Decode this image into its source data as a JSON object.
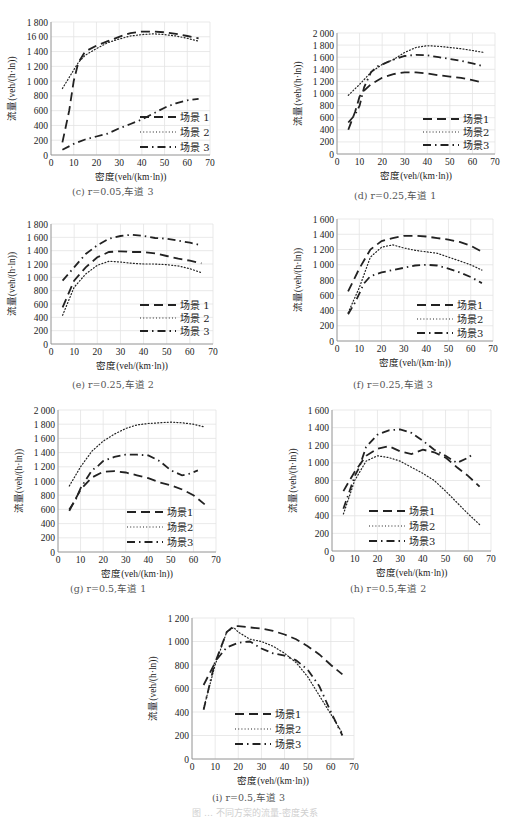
{
  "figure_caption_partial": "图 … 不同方案的流量-密度关系",
  "chart_data": [
    {
      "id": "c",
      "type": "line",
      "caption": "(c) r=0.05,车道 3",
      "xlabel": "密度(veh/(km·ln))",
      "ylabel": "流量(veh/(h·ln))",
      "xlim": [
        0,
        70
      ],
      "ylim": [
        0,
        1800
      ],
      "xticks": [
        "0",
        "10",
        "20",
        "30",
        "40",
        "50",
        "60",
        "70"
      ],
      "yticks": [
        "0",
        "200",
        "400",
        "600",
        "800",
        "1 000",
        "1 200",
        "1 400",
        "16 00",
        "1 800"
      ],
      "grid": true,
      "legend": "bottom-right",
      "series": [
        {
          "name": "场景 1",
          "style": "dash",
          "x": [
            5,
            8,
            10,
            12,
            15,
            20,
            25,
            30,
            35,
            40,
            45,
            50,
            55,
            60,
            65
          ],
          "y": [
            170,
            600,
            1000,
            1250,
            1400,
            1480,
            1540,
            1600,
            1650,
            1670,
            1670,
            1660,
            1640,
            1610,
            1580
          ]
        },
        {
          "name": "场景 2",
          "style": "dot",
          "x": [
            5,
            8,
            10,
            12,
            15,
            20,
            25,
            30,
            35,
            40,
            45,
            50,
            55,
            60,
            65
          ],
          "y": [
            900,
            1050,
            1150,
            1250,
            1350,
            1440,
            1520,
            1570,
            1610,
            1630,
            1640,
            1630,
            1610,
            1580,
            1540
          ]
        },
        {
          "name": "场景 3",
          "style": "dashdot",
          "x": [
            5,
            10,
            15,
            20,
            25,
            30,
            35,
            40,
            45,
            50,
            55,
            60,
            65
          ],
          "y": [
            70,
            150,
            210,
            250,
            290,
            360,
            420,
            480,
            560,
            640,
            700,
            740,
            760
          ]
        }
      ]
    },
    {
      "id": "d",
      "type": "line",
      "caption": "(d) r=0.25,车道 1",
      "xlabel": "密度(veh/(km·ln))",
      "ylabel": "流量(veh/(h·ln))",
      "xlim": [
        0,
        70
      ],
      "ylim": [
        0,
        2000
      ],
      "xticks": [
        "0",
        "10",
        "20",
        "30",
        "40",
        "50",
        "60",
        "70"
      ],
      "yticks": [
        "0",
        "200",
        "400",
        "600",
        "800",
        "1 000",
        "1 200",
        "1 400",
        "1 600",
        "1 800",
        "2 000"
      ],
      "grid": true,
      "legend": "bottom-right",
      "series": [
        {
          "name": "场景1",
          "style": "dash",
          "x": [
            5,
            8,
            10,
            12,
            15,
            20,
            25,
            30,
            35,
            40,
            45,
            50,
            55,
            60,
            65
          ],
          "y": [
            400,
            700,
            950,
            1050,
            1150,
            1260,
            1320,
            1350,
            1350,
            1330,
            1300,
            1280,
            1260,
            1220,
            1180
          ]
        },
        {
          "name": "场景2",
          "style": "dot",
          "x": [
            5,
            10,
            15,
            20,
            25,
            30,
            35,
            40,
            45,
            50,
            55,
            60,
            65
          ],
          "y": [
            970,
            1150,
            1350,
            1480,
            1560,
            1680,
            1760,
            1790,
            1780,
            1760,
            1740,
            1710,
            1680
          ]
        },
        {
          "name": "场景3",
          "style": "dashdot",
          "x": [
            5,
            8,
            10,
            12,
            15,
            18,
            20,
            25,
            30,
            35,
            40,
            45,
            50,
            55,
            60,
            65
          ],
          "y": [
            520,
            650,
            800,
            1100,
            1350,
            1450,
            1480,
            1560,
            1620,
            1640,
            1630,
            1600,
            1570,
            1540,
            1500,
            1450
          ]
        }
      ]
    },
    {
      "id": "e",
      "type": "line",
      "caption": "(e) r=0.25,车道 2",
      "xlabel": "密度(veh/(km·ln))",
      "ylabel": "流量(veh/(h·ln))",
      "xlim": [
        0,
        70
      ],
      "ylim": [
        0,
        1800
      ],
      "xticks": [
        "0",
        "10",
        "20",
        "30",
        "40",
        "50",
        "60",
        "70"
      ],
      "yticks": [
        "0",
        "200",
        "400",
        "600",
        "800",
        "1 000",
        "1 200",
        "1 400",
        "1 600",
        "1 800"
      ],
      "grid": true,
      "legend": "bottom-right",
      "series": [
        {
          "name": "场景 1",
          "style": "dash",
          "x": [
            5,
            10,
            15,
            20,
            25,
            30,
            35,
            40,
            45,
            50,
            55,
            60,
            65
          ],
          "y": [
            550,
            950,
            1150,
            1300,
            1380,
            1390,
            1380,
            1380,
            1360,
            1320,
            1280,
            1250,
            1210
          ]
        },
        {
          "name": "场景 2",
          "style": "dot",
          "x": [
            5,
            10,
            15,
            20,
            25,
            30,
            35,
            40,
            45,
            50,
            55,
            60,
            65
          ],
          "y": [
            430,
            850,
            1050,
            1180,
            1240,
            1230,
            1210,
            1200,
            1200,
            1190,
            1170,
            1130,
            1070
          ]
        },
        {
          "name": "场景 3",
          "style": "dashdot",
          "x": [
            5,
            10,
            15,
            20,
            25,
            30,
            35,
            40,
            45,
            50,
            55,
            60,
            65
          ],
          "y": [
            950,
            1150,
            1350,
            1480,
            1580,
            1620,
            1640,
            1620,
            1590,
            1580,
            1550,
            1520,
            1480
          ]
        }
      ]
    },
    {
      "id": "f",
      "type": "line",
      "caption": "(f) r=0.25,车道 3",
      "xlabel": "密度(veh/(km·ln))",
      "ylabel": "流量(veh/(h·ln))",
      "xlim": [
        0,
        70
      ],
      "ylim": [
        0,
        1600
      ],
      "xticks": [
        "0",
        "10",
        "20",
        "30",
        "40",
        "50",
        "60",
        "70"
      ],
      "yticks": [
        "0",
        "200",
        "400",
        "600",
        "800",
        "1 000",
        "1 200",
        "1 400",
        "1 600"
      ],
      "grid": true,
      "legend": "bottom-right",
      "series": [
        {
          "name": "场景1",
          "style": "dash",
          "x": [
            5,
            10,
            15,
            20,
            25,
            30,
            35,
            40,
            45,
            50,
            55,
            60,
            65
          ],
          "y": [
            650,
            950,
            1200,
            1310,
            1350,
            1380,
            1380,
            1370,
            1350,
            1330,
            1300,
            1250,
            1170
          ]
        },
        {
          "name": "场景2",
          "style": "dot",
          "x": [
            5,
            10,
            15,
            20,
            25,
            30,
            35,
            40,
            45,
            50,
            55,
            60,
            65
          ],
          "y": [
            370,
            700,
            1100,
            1230,
            1260,
            1220,
            1190,
            1170,
            1150,
            1100,
            1050,
            1000,
            930
          ]
        },
        {
          "name": "场景3",
          "style": "dashdot",
          "x": [
            5,
            8,
            10,
            12,
            15,
            20,
            25,
            30,
            35,
            40,
            45,
            50,
            55,
            60,
            65
          ],
          "y": [
            350,
            500,
            620,
            750,
            850,
            900,
            930,
            960,
            990,
            1000,
            990,
            950,
            900,
            840,
            760
          ]
        }
      ]
    },
    {
      "id": "g",
      "type": "line",
      "caption": "(g) r=0.5,车道 1",
      "xlabel": "密度(veh/(km·ln))",
      "ylabel": "流量(veh/(h·ln))",
      "xlim": [
        0,
        70
      ],
      "ylim": [
        0,
        2000
      ],
      "xticks": [
        "0",
        "10",
        "20",
        "30",
        "40",
        "50",
        "60",
        "70"
      ],
      "yticks": [
        "0",
        "200",
        "400",
        "600",
        "800",
        "1 000",
        "1 200",
        "1 400",
        "1 600",
        "1 800",
        "2 000"
      ],
      "grid": true,
      "legend": "bottom-right",
      "series": [
        {
          "name": "场景1",
          "style": "dash",
          "x": [
            5,
            10,
            15,
            20,
            25,
            30,
            35,
            40,
            45,
            50,
            55,
            60,
            65
          ],
          "y": [
            580,
            880,
            1050,
            1130,
            1140,
            1120,
            1080,
            1040,
            980,
            940,
            880,
            800,
            670
          ]
        },
        {
          "name": "场景2",
          "style": "dot",
          "x": [
            5,
            10,
            15,
            20,
            25,
            30,
            35,
            40,
            45,
            50,
            55,
            60,
            65
          ],
          "y": [
            930,
            1200,
            1420,
            1560,
            1660,
            1740,
            1790,
            1810,
            1820,
            1830,
            1820,
            1800,
            1760
          ]
        },
        {
          "name": "场景3",
          "style": "dashdot",
          "x": [
            5,
            8,
            10,
            12,
            15,
            18,
            20,
            25,
            30,
            35,
            40,
            45,
            50,
            55,
            58,
            62
          ],
          "y": [
            600,
            750,
            900,
            1000,
            1150,
            1220,
            1280,
            1340,
            1370,
            1370,
            1360,
            1280,
            1150,
            1080,
            1100,
            1150
          ]
        }
      ]
    },
    {
      "id": "h",
      "type": "line",
      "caption": "(h) r=0.5,车道 2",
      "xlabel": "密度(veh/(km·ln))",
      "ylabel": "流量(veh/(h·ln))",
      "xlim": [
        0,
        70
      ],
      "ylim": [
        0,
        1600
      ],
      "xticks": [
        "0",
        "10",
        "20",
        "30",
        "40",
        "50",
        "60",
        "70"
      ],
      "yticks": [
        "0",
        "200",
        "400",
        "600",
        "800",
        "1 000",
        "1 200",
        "1 400",
        "1 600"
      ],
      "grid": true,
      "legend": "bottom-left",
      "series": [
        {
          "name": "场景1",
          "style": "dash",
          "x": [
            5,
            10,
            15,
            20,
            25,
            30,
            35,
            40,
            45,
            50,
            55,
            60,
            65
          ],
          "y": [
            680,
            900,
            1080,
            1160,
            1190,
            1130,
            1100,
            1150,
            1120,
            1060,
            950,
            850,
            730
          ]
        },
        {
          "name": "场景2",
          "style": "dot",
          "x": [
            5,
            10,
            15,
            20,
            25,
            30,
            35,
            40,
            45,
            50,
            55,
            60,
            65
          ],
          "y": [
            420,
            800,
            1020,
            1080,
            1060,
            1020,
            950,
            880,
            800,
            680,
            550,
            420,
            300
          ]
        },
        {
          "name": "场景3",
          "style": "dashdot",
          "x": [
            5,
            8,
            10,
            12,
            15,
            20,
            25,
            30,
            35,
            40,
            45,
            50,
            55,
            60,
            62
          ],
          "y": [
            480,
            700,
            850,
            950,
            1180,
            1320,
            1370,
            1380,
            1340,
            1250,
            1150,
            1080,
            1000,
            1060,
            1100
          ]
        }
      ]
    },
    {
      "id": "i",
      "type": "line",
      "caption": "(i) r=0.5,车道 3",
      "xlabel": "密度(veh/(km·ln))",
      "ylabel": "流量(veh/(h·ln))",
      "xlim": [
        0,
        70
      ],
      "ylim": [
        0,
        1200
      ],
      "xticks": [
        "0",
        "10",
        "20",
        "30",
        "40",
        "50",
        "60",
        "70"
      ],
      "yticks": [
        "0",
        "200",
        "400",
        "600",
        "800",
        "1 000",
        "1 200"
      ],
      "grid": true,
      "legend": "bottom-left",
      "series": [
        {
          "name": "场景1",
          "style": "dash",
          "x": [
            5,
            10,
            15,
            18,
            20,
            25,
            30,
            35,
            40,
            45,
            50,
            55,
            60,
            65
          ],
          "y": [
            630,
            820,
            1080,
            1130,
            1130,
            1120,
            1110,
            1090,
            1060,
            1020,
            960,
            890,
            800,
            720
          ]
        },
        {
          "name": "场景2",
          "style": "dot",
          "x": [
            5,
            10,
            15,
            18,
            20,
            25,
            30,
            35,
            40,
            45,
            50,
            55,
            60,
            65
          ],
          "y": [
            430,
            800,
            1080,
            1120,
            1080,
            1020,
            1000,
            960,
            900,
            820,
            700,
            540,
            380,
            220
          ]
        },
        {
          "name": "场景3",
          "style": "dashdot",
          "x": [
            5,
            10,
            15,
            20,
            25,
            30,
            35,
            40,
            45,
            50,
            55,
            60,
            65
          ],
          "y": [
            420,
            830,
            950,
            990,
            1000,
            940,
            900,
            880,
            840,
            760,
            620,
            400,
            200
          ]
        }
      ]
    }
  ]
}
